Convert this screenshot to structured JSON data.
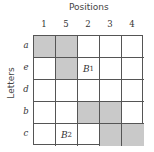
{
  "title": "Positions",
  "ylabel": "Letters",
  "columns": [
    "1",
    "5",
    "2",
    "3",
    "4"
  ],
  "rows": [
    {
      "label": "a",
      "cells": [
        {
          "shaded": true,
          "text": ""
        },
        {
          "shaded": true,
          "text": ""
        },
        {
          "shaded": false,
          "text": ""
        },
        {
          "shaded": false,
          "text": ""
        },
        {
          "shaded": false,
          "text": ""
        }
      ]
    },
    {
      "label": "e",
      "cells": [
        {
          "shaded": false,
          "text": ""
        },
        {
          "shaded": true,
          "text": ""
        },
        {
          "shaded": false,
          "text": "B",
          "sub": "1"
        },
        {
          "shaded": false,
          "text": ""
        },
        {
          "shaded": false,
          "text": ""
        }
      ]
    },
    {
      "label": "d",
      "cells": [
        {
          "shaded": false,
          "text": ""
        },
        {
          "shaded": false,
          "text": ""
        },
        {
          "shaded": false,
          "text": ""
        },
        {
          "shaded": false,
          "text": ""
        },
        {
          "shaded": false,
          "text": ""
        }
      ]
    },
    {
      "label": "b",
      "cells": [
        {
          "shaded": false,
          "text": ""
        },
        {
          "shaded": false,
          "text": ""
        },
        {
          "shaded": true,
          "text": ""
        },
        {
          "shaded": true,
          "text": ""
        },
        {
          "shaded": false,
          "text": ""
        }
      ]
    },
    {
      "label": "c",
      "cells": [
        {
          "shaded": false,
          "text": ""
        },
        {
          "shaded": false,
          "text": "B",
          "sub": "2"
        },
        {
          "shaded": false,
          "text": ""
        },
        {
          "shaded": true,
          "text": ""
        },
        {
          "shaded": true,
          "text": ""
        }
      ]
    }
  ],
  "colors": {
    "shade": "#c9c9c9",
    "line": "#555555"
  }
}
